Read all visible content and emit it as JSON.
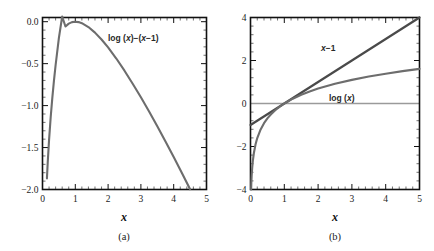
{
  "figure": {
    "panels": [
      {
        "id": "a",
        "subcaption": "(a)",
        "xlabel": "x",
        "curve_label": "log (x)−(x−1)"
      },
      {
        "id": "b",
        "subcaption": "(b)",
        "xlabel": "x",
        "label_line": "x−1",
        "label_log": "log (x)"
      }
    ]
  },
  "chart_data": [
    {
      "type": "line",
      "panel": "a",
      "title": "",
      "xlabel": "x",
      "ylabel": "",
      "xlim": [
        0,
        5
      ],
      "ylim": [
        -2,
        0.05
      ],
      "grid": false,
      "legend_position": "inline-annotation",
      "xticks": [
        0,
        1,
        2,
        3,
        4,
        5
      ],
      "xtick_labels": [
        "0",
        "1",
        "2",
        "3",
        "4",
        "5"
      ],
      "yticks": [
        0.0,
        -0.5,
        -1.0,
        -1.5,
        -2.0
      ],
      "ytick_labels": [
        "0.0",
        "-0.5",
        "-1.0",
        "-1.5",
        "-2.0"
      ],
      "minor_ticks_per_interval": 5,
      "series": [
        {
          "name": "log (x)-(x-1)",
          "color": "#6d6d6d",
          "annotation": "log (x)−(x−1)",
          "annotation_xy": [
            1.95,
            -0.22
          ],
          "x": [
            0.135,
            0.16,
            0.2,
            0.25,
            0.3,
            0.35,
            0.4,
            0.5,
            0.6,
            0.7,
            0.8,
            0.9,
            1.0,
            1.1,
            1.2,
            1.4,
            1.6,
            1.8,
            2.0,
            2.25,
            2.5,
            2.75,
            3.0,
            3.25,
            3.5,
            3.75,
            4.0,
            4.25,
            4.5
          ],
          "y": [
            -1.868,
            -1.673,
            -1.409,
            -1.136,
            -0.904,
            -0.7,
            -0.516,
            -0.193,
            0.089,
            -0.057,
            -0.023,
            -0.005,
            0.0,
            -0.005,
            -0.018,
            -0.064,
            -0.13,
            -0.212,
            -0.307,
            -0.439,
            -0.584,
            -0.739,
            -0.901,
            -1.071,
            -1.247,
            -1.428,
            -1.614,
            -1.803,
            -1.996
          ],
          "note": "y = ln(x) - (x - 1); maximum at x=1, y=0"
        }
      ]
    },
    {
      "type": "line",
      "panel": "b",
      "title": "",
      "xlabel": "x",
      "ylabel": "",
      "xlim": [
        0,
        5
      ],
      "ylim": [
        -4,
        4
      ],
      "grid": false,
      "legend_position": "inline-annotation",
      "xticks": [
        0,
        1,
        2,
        3,
        4,
        5
      ],
      "xtick_labels": [
        "0",
        "1",
        "2",
        "3",
        "4",
        "5"
      ],
      "yticks": [
        4,
        2,
        0,
        -2,
        -4
      ],
      "ytick_labels": [
        "4",
        "2",
        "0",
        "-2",
        "-4"
      ],
      "minor_ticks_per_interval": 5,
      "zero_line": 0,
      "series": [
        {
          "name": "x-1",
          "color": "#4a4a4a",
          "annotation": "x−1",
          "annotation_xy": [
            2.55,
            2.55
          ],
          "x": [
            0,
            1,
            2,
            3,
            4,
            5
          ],
          "y": [
            -1,
            0,
            1,
            2,
            3,
            4
          ],
          "note": "straight line y = x - 1"
        },
        {
          "name": "log (x)",
          "color": "#6d6d6d",
          "annotation": "log (x)",
          "annotation_xy": [
            2.75,
            0.72
          ],
          "x": [
            0.0183,
            0.025,
            0.035,
            0.05,
            0.07,
            0.1,
            0.15,
            0.2,
            0.3,
            0.4,
            0.5,
            0.6,
            0.7,
            0.8,
            0.9,
            1.0,
            1.25,
            1.5,
            1.75,
            2.0,
            2.5,
            3.0,
            3.5,
            4.0,
            4.5,
            5.0
          ],
          "y": [
            -4.0,
            -3.689,
            -3.352,
            -2.996,
            -2.659,
            -2.303,
            -1.897,
            -1.609,
            -1.204,
            -0.916,
            -0.693,
            -0.511,
            -0.357,
            -0.223,
            -0.105,
            0.0,
            0.223,
            0.405,
            0.56,
            0.693,
            0.916,
            1.099,
            1.253,
            1.386,
            1.504,
            1.609
          ],
          "note": "y = ln(x)"
        }
      ]
    }
  ]
}
